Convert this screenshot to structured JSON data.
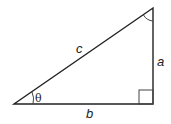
{
  "diagram": {
    "type": "right-triangle",
    "labels": {
      "hypotenuse": "c",
      "vertical_side": "a",
      "horizontal_side": "b",
      "angle": "θ"
    },
    "markers": {
      "right_angle": "bottom-right corner",
      "angle_arc_top": "top corner"
    },
    "colors": {
      "stroke": "#222222",
      "background": "#ffffff"
    }
  }
}
